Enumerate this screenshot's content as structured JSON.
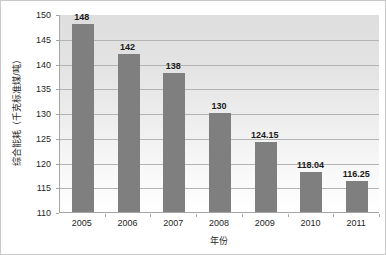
{
  "chart_data": {
    "type": "bar",
    "title": "",
    "xlabel": "年份",
    "ylabel": "综合能耗（千克标准煤/吨）",
    "categories": [
      "2005",
      "2006",
      "2007",
      "2008",
      "2009",
      "2010",
      "2011"
    ],
    "values": [
      148,
      142,
      138,
      130,
      124.15,
      118.04,
      116.25
    ],
    "value_labels": [
      "148",
      "142",
      "138",
      "130",
      "124.15",
      "118.04",
      "116.25"
    ],
    "ylim": [
      110,
      150
    ],
    "ytick_labels": [
      "110",
      "115",
      "120",
      "125",
      "130",
      "135",
      "140",
      "145",
      "150"
    ],
    "ytick_values": [
      110,
      115,
      120,
      125,
      130,
      135,
      140,
      145,
      150
    ],
    "grid": true,
    "legend": "none",
    "series": [
      {
        "name": "综合能耗",
        "values": [
          148,
          142,
          138,
          130,
          124.15,
          118.04,
          116.25
        ]
      }
    ],
    "colors": {
      "bar": "#7f7f7f",
      "gridline": "#b3b3b3",
      "axis": "#a6a6a6",
      "figure_border": "#c9c9c9",
      "text": "#262626",
      "label_text": "#1a1a1a",
      "plot_background_top": "#dedede",
      "plot_background_bottom": "#ffffff"
    }
  }
}
